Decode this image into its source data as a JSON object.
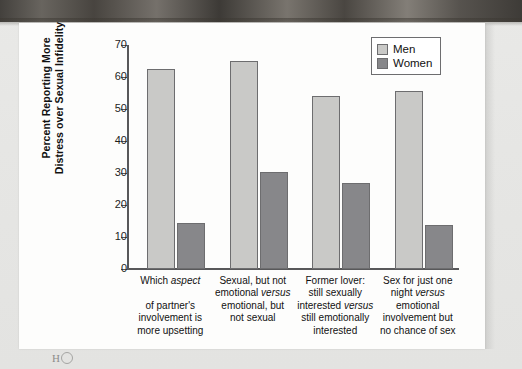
{
  "figure": {
    "background_color": "#fdfdfc",
    "page_color": "#e7e7e5",
    "bottom_artifact": "H"
  },
  "legend": {
    "position": "top-right",
    "items": [
      {
        "label": "Men",
        "color": "#c9c9c7"
      },
      {
        "label": "Women",
        "color": "#87878a"
      }
    ]
  },
  "axis": {
    "y_title_line1": "Percent Reporting More",
    "y_title_line2": "Distress over Sexual Infidelity",
    "y_ticks": [
      "70",
      "60",
      "50",
      "40",
      "30",
      "20",
      "10",
      "0"
    ]
  },
  "chart_data": {
    "type": "bar",
    "title": "",
    "xlabel": "",
    "ylabel": "Percent Reporting More Distress over Sexual Infidelity",
    "ylim": [
      0,
      70
    ],
    "ytick_step": 10,
    "grid": false,
    "legend_position": "top-right",
    "categories": [
      "Which aspect of partner's involvement is more upsetting",
      "Sexual, but not emotional versus emotional, but not sexual",
      "Former lover: still sexually interested versus still emotionally interested",
      "Sex for just one night versus emotional involvement but no chance of sex"
    ],
    "category_lines": [
      [
        "Which ",
        "aspect",
        "",
        "of partner's",
        "involvement is",
        "more upsetting"
      ],
      [
        "Sexual, but not",
        "emotional ",
        "versus",
        "emotional, but",
        "not sexual"
      ],
      [
        "Former lover:",
        "still sexually",
        "interested ",
        "versus",
        "still emotionally",
        "interested"
      ],
      [
        "Sex for just one",
        "night ",
        "versus",
        "emotional",
        "involvement but",
        "no chance of sex"
      ]
    ],
    "series": [
      {
        "name": "Men",
        "color": "#c9c9c7",
        "values": [
          62.5,
          65.0,
          54.0,
          55.5
        ]
      },
      {
        "name": "Women",
        "color": "#87878a",
        "values": [
          14.3,
          30.3,
          27.0,
          13.7
        ]
      }
    ]
  }
}
